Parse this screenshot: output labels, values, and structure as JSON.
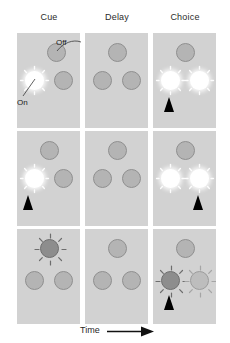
{
  "figure": {
    "background_color": "#ffffff",
    "panel_color": "#d2d2d2",
    "width": 230,
    "height": 343
  },
  "columns": [
    {
      "id": "cue",
      "label": "Cue"
    },
    {
      "id": "delay",
      "label": "Delay"
    },
    {
      "id": "choice",
      "label": "Choice"
    }
  ],
  "callouts": {
    "off": {
      "label": "Off",
      "description": "unlit nose-poke port"
    },
    "on": {
      "label": "On",
      "description": "illuminated nose-poke port"
    }
  },
  "time_axis": {
    "label": "Time",
    "arrow": "right-arrow"
  },
  "legend_colors": {
    "light_on": "#ffffff",
    "light_off": "#b4b4b4",
    "light_off_border": "#8f8f8f",
    "response_dark": "#8d8d8d",
    "response_pale": "#bdbdbd",
    "arrow": "#000000"
  },
  "trials": [
    {
      "row": 1,
      "panels": [
        {
          "column": "cue",
          "lights": [
            {
              "name": "top-port",
              "state": "off",
              "x": 30,
              "y": 10
            },
            {
              "name": "left-port",
              "state": "on",
              "x": 8,
              "y": 38
            },
            {
              "name": "right-port",
              "state": "off",
              "x": 37,
              "y": 38
            }
          ],
          "arrow": null
        },
        {
          "column": "delay",
          "lights": [
            {
              "name": "top-port",
              "state": "off",
              "x": 23,
              "y": 10
            },
            {
              "name": "left-port",
              "state": "off",
              "x": 8,
              "y": 38
            },
            {
              "name": "right-port",
              "state": "off",
              "x": 37,
              "y": 38
            }
          ],
          "arrow": null
        },
        {
          "column": "choice",
          "lights": [
            {
              "name": "top-port",
              "state": "off",
              "x": 23,
              "y": 10
            },
            {
              "name": "left-port",
              "state": "on",
              "x": 8,
              "y": 38
            },
            {
              "name": "right-port",
              "state": "on",
              "x": 37,
              "y": 38
            }
          ],
          "arrow": {
            "name": "response-arrow-left",
            "x": 11,
            "y": 64
          }
        }
      ]
    },
    {
      "row": 2,
      "panels": [
        {
          "column": "cue",
          "lights": [
            {
              "name": "top-port",
              "state": "off",
              "x": 23,
              "y": 10
            },
            {
              "name": "left-port",
              "state": "on",
              "x": 8,
              "y": 38
            },
            {
              "name": "right-port",
              "state": "off",
              "x": 37,
              "y": 38
            }
          ],
          "arrow": {
            "name": "response-arrow-left",
            "x": 6,
            "y": 64
          }
        },
        {
          "column": "delay",
          "lights": [
            {
              "name": "top-port",
              "state": "off",
              "x": 23,
              "y": 10
            },
            {
              "name": "left-port",
              "state": "off",
              "x": 8,
              "y": 38
            },
            {
              "name": "right-port",
              "state": "off",
              "x": 37,
              "y": 38
            }
          ],
          "arrow": null
        },
        {
          "column": "choice",
          "lights": [
            {
              "name": "top-port",
              "state": "off",
              "x": 23,
              "y": 10
            },
            {
              "name": "left-port",
              "state": "on",
              "x": 8,
              "y": 38
            },
            {
              "name": "right-port",
              "state": "on",
              "x": 37,
              "y": 38
            }
          ],
          "arrow": {
            "name": "response-arrow-right",
            "x": 40,
            "y": 64
          }
        }
      ]
    },
    {
      "row": 3,
      "panels": [
        {
          "column": "cue",
          "lights": [
            {
              "name": "top-port",
              "state": "dark-rays",
              "x": 23,
              "y": 10
            },
            {
              "name": "left-port",
              "state": "off",
              "x": 8,
              "y": 42
            },
            {
              "name": "right-port",
              "state": "off",
              "x": 37,
              "y": 42
            }
          ],
          "arrow": null
        },
        {
          "column": "delay",
          "lights": [
            {
              "name": "top-port",
              "state": "off",
              "x": 23,
              "y": 10
            },
            {
              "name": "left-port",
              "state": "off",
              "x": 8,
              "y": 42
            },
            {
              "name": "right-port",
              "state": "off",
              "x": 37,
              "y": 42
            }
          ],
          "arrow": null
        },
        {
          "column": "choice",
          "lights": [
            {
              "name": "top-port",
              "state": "off",
              "x": 23,
              "y": 10
            },
            {
              "name": "left-port",
              "state": "dark-rays",
              "x": 8,
              "y": 42
            },
            {
              "name": "right-port",
              "state": "pale-rays",
              "x": 37,
              "y": 42
            }
          ],
          "arrow": {
            "name": "response-arrow-left",
            "x": 11,
            "y": 66
          }
        }
      ]
    }
  ]
}
